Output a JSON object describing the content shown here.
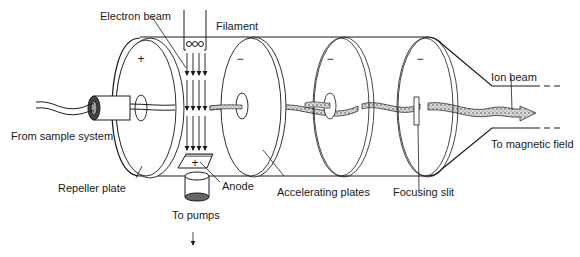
{
  "diagram": {
    "labels": {
      "electron_beam": "Electron beam",
      "filament": "Filament",
      "ion_beam": "Ion beam",
      "from_sample": "From sample system",
      "to_magnetic": "To magnetic field",
      "repeller": "Repeller plate",
      "anode": "Anode",
      "accelerating": "Accelerating plates",
      "focusing": "Focusing slit",
      "to_pumps": "To pumps"
    },
    "charges": {
      "repeller": "+",
      "anode": "+",
      "plate1": "−",
      "plate2": "−",
      "plate3": "−"
    },
    "colors": {
      "line": "#1a1a1a",
      "beam_fill": "#8a8a8a",
      "background": "#ffffff"
    }
  }
}
